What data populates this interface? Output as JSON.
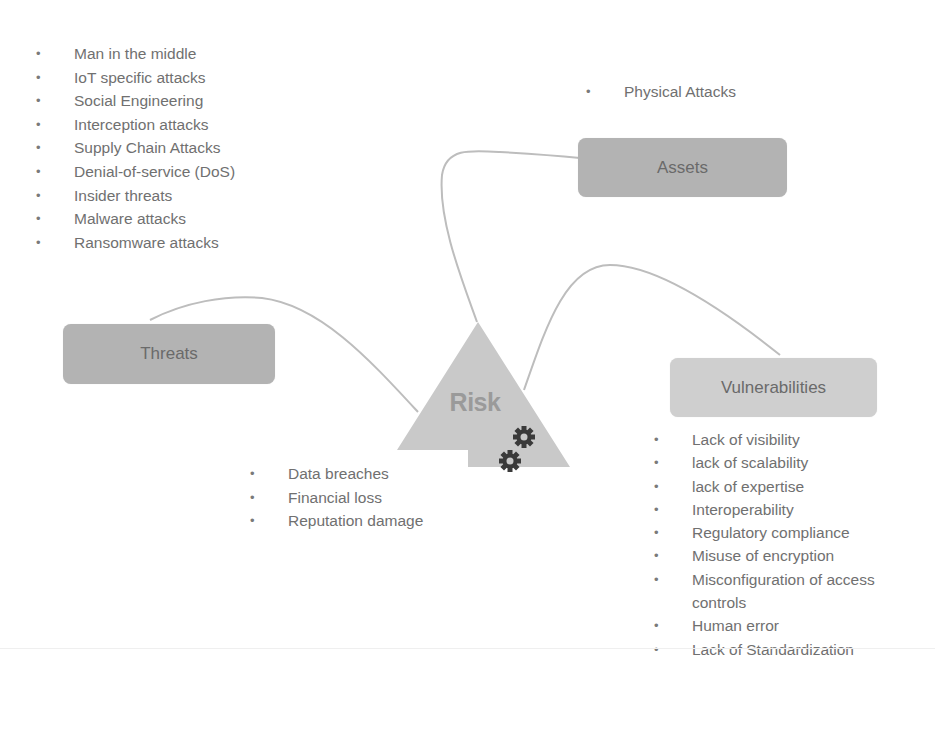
{
  "diagram": {
    "center": {
      "label": "Risk",
      "icon": "gears-icon"
    },
    "nodes": {
      "assets": {
        "label": "Assets"
      },
      "threats": {
        "label": "Threats"
      },
      "vulnerabilities": {
        "label": "Vulnerabilities"
      }
    },
    "lists": {
      "threats": [
        "Man in the middle",
        "IoT specific attacks",
        "Social Engineering",
        "Interception attacks",
        "Supply Chain Attacks",
        "Denial-of-service (DoS)",
        "Insider threats",
        "Malware attacks",
        "Ransomware attacks"
      ],
      "assets": [
        "Physical Attacks"
      ],
      "impacts": [
        "Data breaches",
        "Financial loss",
        "Reputation damage"
      ],
      "vulnerabilities": [
        "Lack of visibility",
        "lack of scalability",
        "lack of expertise",
        "Interoperability",
        "Regulatory compliance",
        "Misuse of encryption",
        "Misconfiguration of access controls",
        "Human error",
        "Lack of Standardization"
      ]
    },
    "colors": {
      "dark_box": "#b3b3b3",
      "light_box": "#cfcfcf",
      "triangle": "#c9c9c9",
      "connector": "#bdbdbd",
      "gear": "#3a3a3a",
      "text": "#707070"
    }
  }
}
